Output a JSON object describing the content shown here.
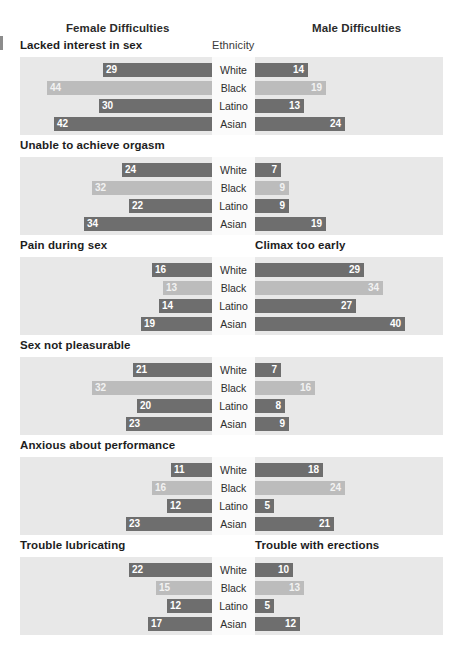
{
  "headers": {
    "female_title": "Female Difficulties",
    "male_title": "Male Difficulties",
    "center_title": "Ethnicity"
  },
  "chart_data": {
    "type": "bar",
    "orientation": "horizontal-paired",
    "xlabel": "",
    "ylabel": "Ethnicity",
    "xlim": [
      0,
      50
    ],
    "grid": false,
    "legend": "none",
    "categories": [
      "White",
      "Black",
      "Latino",
      "Asian"
    ],
    "category_colors": [
      "dark",
      "light",
      "dark",
      "dark"
    ],
    "colors": {
      "dark_bar": "#6e6e6e",
      "light_bar": "#bcbcbc",
      "panel_bg": "#e8e8e8",
      "center_bg": "#fbfbfb"
    },
    "panels": [
      {
        "female_label": "Lacked interest in sex",
        "male_label": "",
        "female_values": [
          29,
          44,
          30,
          42
        ],
        "male_values": [
          14,
          19,
          13,
          24
        ]
      },
      {
        "female_label": "Unable to achieve orgasm",
        "male_label": "",
        "female_values": [
          24,
          32,
          22,
          34
        ],
        "male_values": [
          7,
          9,
          9,
          19
        ]
      },
      {
        "female_label": "Pain during sex",
        "male_label": "Climax too early",
        "female_values": [
          16,
          13,
          14,
          19
        ],
        "male_values": [
          29,
          34,
          27,
          40
        ]
      },
      {
        "female_label": "Sex not pleasurable",
        "male_label": "",
        "female_values": [
          21,
          32,
          20,
          23
        ],
        "male_values": [
          7,
          16,
          8,
          9
        ]
      },
      {
        "female_label": "Anxious about performance",
        "male_label": "",
        "female_values": [
          11,
          16,
          12,
          23
        ],
        "male_values": [
          18,
          24,
          5,
          21
        ]
      },
      {
        "female_label": "Trouble lubricating",
        "male_label": "Trouble with erections",
        "female_values": [
          22,
          15,
          12,
          17
        ],
        "male_values": [
          10,
          13,
          5,
          12
        ]
      }
    ]
  }
}
